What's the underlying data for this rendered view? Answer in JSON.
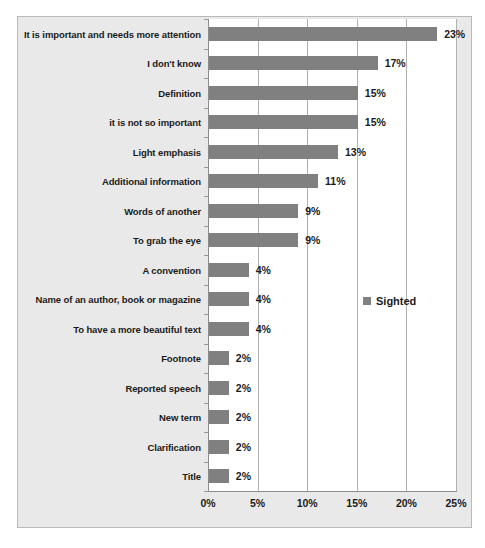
{
  "chart_data": {
    "type": "bar",
    "orientation": "horizontal",
    "title": "",
    "xlabel": "",
    "ylabel": "",
    "xlim": [
      0,
      25
    ],
    "xticks": [
      "0%",
      "5%",
      "10%",
      "15%",
      "20%",
      "25%"
    ],
    "xtick_values": [
      0,
      5,
      10,
      15,
      20,
      25
    ],
    "grid": true,
    "legend_position": "middle-right",
    "categories": [
      "It is important and needs more attention",
      "I don't know",
      "Definition",
      "it is not so important",
      "Light emphasis",
      "Additional information",
      "Words of another",
      "To grab the eye",
      "A convention",
      "Name of an author, book or magazine",
      "To have a more beautiful text",
      "Footnote",
      "Reported speech",
      "New term",
      "Clarification",
      "Title"
    ],
    "values": [
      23,
      17,
      15,
      15,
      13,
      11,
      9,
      9,
      4,
      4,
      4,
      2,
      2,
      2,
      2,
      2
    ],
    "value_labels": [
      "23%",
      "17%",
      "15%",
      "15%",
      "13%",
      "11%",
      "9%",
      "9%",
      "4%",
      "4%",
      "4%",
      "2%",
      "2%",
      "2%",
      "2%",
      "2%"
    ],
    "series": [
      {
        "name": "Sighted",
        "color": "#808080",
        "values": [
          23,
          17,
          15,
          15,
          13,
          11,
          9,
          9,
          4,
          4,
          4,
          2,
          2,
          2,
          2,
          2
        ]
      }
    ]
  },
  "legend": {
    "entries": [
      {
        "label": "Sighted",
        "color": "#808080"
      }
    ]
  },
  "colors": {
    "bar": "#808080",
    "figure_background": "#e9e9e9",
    "plot_background": "#ffffff",
    "gridline": "#b0b0b0",
    "axis": "#8c8c8c",
    "text": "#1b1b1b"
  }
}
